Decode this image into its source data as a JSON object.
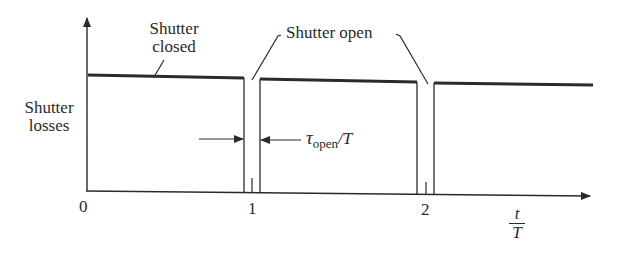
{
  "diagram": {
    "y_axis_label_line1": "Shutter",
    "y_axis_label_line2": "losses",
    "x_axis_label_num": "t",
    "x_axis_label_den": "T",
    "tick_labels": [
      "0",
      "1",
      "2"
    ],
    "annotations": {
      "closed_line1": "Shutter",
      "closed_line2": "closed",
      "open": "Shutter open",
      "tau_symbol": "τ",
      "tau_sub": "open",
      "tau_tail": "/T"
    },
    "colors": {
      "ink": "#2a2a2a",
      "background": "#ffffff"
    }
  }
}
